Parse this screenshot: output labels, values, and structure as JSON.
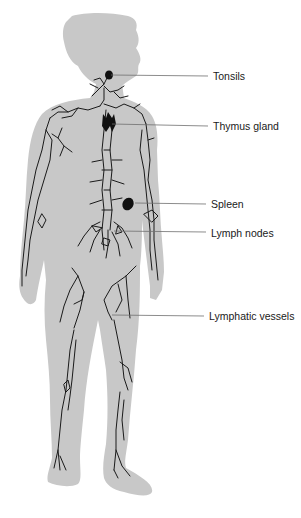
{
  "figure": {
    "colors": {
      "body_fill": "#c8c8c8",
      "vessel_stroke": "#1a1a1a",
      "organ_fill": "#111111",
      "leader_line": "#6e6e6e",
      "label_text": "#1a1a1a"
    },
    "labels": [
      {
        "id": "tonsils",
        "text": "Tonsils",
        "x": 213,
        "y": 70,
        "line_from": [
          111,
          75
        ],
        "line_to": [
          208,
          76
        ]
      },
      {
        "id": "thymus",
        "text": "Thymus gland",
        "x": 213,
        "y": 120,
        "line_from": [
          112,
          124
        ],
        "line_to": [
          208,
          126
        ]
      },
      {
        "id": "spleen",
        "text": "Spleen",
        "x": 211,
        "y": 198,
        "line_from": [
          135,
          203
        ],
        "line_to": [
          206,
          204
        ]
      },
      {
        "id": "lymph-nodes",
        "text": "Lymph nodes",
        "x": 211,
        "y": 227,
        "line_from": [
          114,
          231
        ],
        "line_to": [
          206,
          232
        ]
      },
      {
        "id": "lymphatic-vessels",
        "text": "Lymphatic vessels",
        "x": 209,
        "y": 312,
        "line_from": [
          112,
          315
        ],
        "line_to": [
          204,
          316
        ]
      }
    ]
  }
}
